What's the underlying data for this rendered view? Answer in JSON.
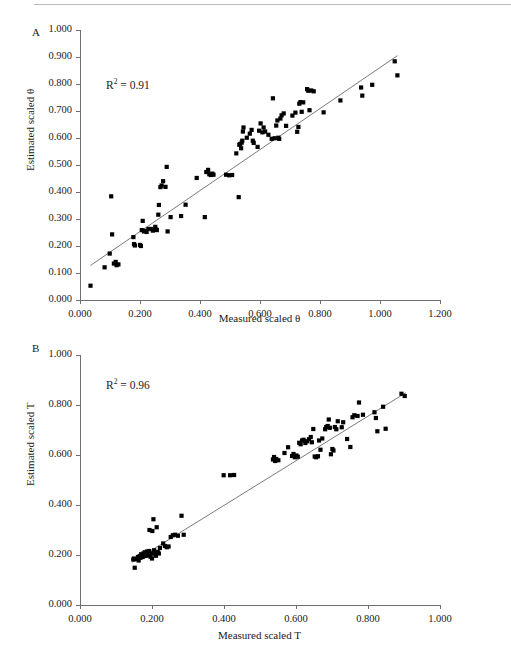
{
  "figure": {
    "background": "#ffffff",
    "point_color": "#000000",
    "line_color": "#7a7a7a",
    "axis_color": "#6f6f6f"
  },
  "panels": [
    {
      "letter": "A",
      "r2_prefix": "R",
      "r2_sup": "2",
      "r2_value": "= 0.91"
    },
    {
      "letter": "B",
      "r2_prefix": "R",
      "r2_sup": "2",
      "r2_value": "= 0.96"
    }
  ],
  "chart_data": [
    {
      "type": "scatter",
      "panel": "A",
      "title": "",
      "xlabel": "Measured scaled θ",
      "ylabel": "Estimated scaled θ",
      "annotation": "R² = 0.91",
      "r_squared": 0.91,
      "xlim": [
        0.0,
        1.2
      ],
      "ylim": [
        0.0,
        1.0
      ],
      "xticks": [
        "0.000",
        "0.200",
        "0.400",
        "0.600",
        "0.800",
        "1.000",
        "1.200"
      ],
      "xtick_values": [
        0.0,
        0.2,
        0.4,
        0.6,
        0.8,
        1.0,
        1.2
      ],
      "yticks": [
        "0.000",
        "0.100",
        "0.200",
        "0.300",
        "0.400",
        "0.500",
        "0.600",
        "0.700",
        "0.800",
        "0.900",
        "1.000"
      ],
      "ytick_values": [
        0.0,
        0.1,
        0.2,
        0.3,
        0.4,
        0.5,
        0.6,
        0.7,
        0.8,
        0.9,
        1.0
      ],
      "grid": false,
      "legend": false,
      "fit_line": {
        "x": [
          0.035,
          1.058
        ],
        "y": [
          0.128,
          0.905
        ]
      },
      "points": [
        [
          0.035,
          0.053
        ],
        [
          0.082,
          0.121
        ],
        [
          0.099,
          0.172
        ],
        [
          0.104,
          0.384
        ],
        [
          0.113,
          0.135
        ],
        [
          0.119,
          0.141
        ],
        [
          0.122,
          0.129
        ],
        [
          0.128,
          0.132
        ],
        [
          0.107,
          0.243
        ],
        [
          0.178,
          0.233
        ],
        [
          0.18,
          0.207
        ],
        [
          0.183,
          0.202
        ],
        [
          0.2,
          0.204
        ],
        [
          0.203,
          0.2
        ],
        [
          0.206,
          0.259
        ],
        [
          0.209,
          0.293
        ],
        [
          0.213,
          0.254
        ],
        [
          0.219,
          0.256
        ],
        [
          0.222,
          0.252
        ],
        [
          0.228,
          0.263
        ],
        [
          0.236,
          0.263
        ],
        [
          0.243,
          0.257
        ],
        [
          0.248,
          0.262
        ],
        [
          0.251,
          0.271
        ],
        [
          0.254,
          0.261
        ],
        [
          0.256,
          0.259
        ],
        [
          0.261,
          0.316
        ],
        [
          0.263,
          0.352
        ],
        [
          0.268,
          0.418
        ],
        [
          0.272,
          0.424
        ],
        [
          0.277,
          0.44
        ],
        [
          0.285,
          0.419
        ],
        [
          0.289,
          0.493
        ],
        [
          0.292,
          0.254
        ],
        [
          0.302,
          0.307
        ],
        [
          0.337,
          0.311
        ],
        [
          0.352,
          0.353
        ],
        [
          0.389,
          0.452
        ],
        [
          0.416,
          0.307
        ],
        [
          0.421,
          0.474
        ],
        [
          0.427,
          0.482
        ],
        [
          0.431,
          0.466
        ],
        [
          0.436,
          0.463
        ],
        [
          0.441,
          0.468
        ],
        [
          0.445,
          0.464
        ],
        [
          0.487,
          0.464
        ],
        [
          0.497,
          0.462
        ],
        [
          0.507,
          0.463
        ],
        [
          0.521,
          0.543
        ],
        [
          0.529,
          0.381
        ],
        [
          0.531,
          0.575
        ],
        [
          0.534,
          0.578
        ],
        [
          0.537,
          0.562
        ],
        [
          0.539,
          0.583
        ],
        [
          0.541,
          0.59
        ],
        [
          0.543,
          0.624
        ],
        [
          0.545,
          0.639
        ],
        [
          0.556,
          0.601
        ],
        [
          0.566,
          0.616
        ],
        [
          0.572,
          0.63
        ],
        [
          0.576,
          0.59
        ],
        [
          0.579,
          0.582
        ],
        [
          0.592,
          0.567
        ],
        [
          0.597,
          0.627
        ],
        [
          0.602,
          0.654
        ],
        [
          0.608,
          0.621
        ],
        [
          0.612,
          0.639
        ],
        [
          0.617,
          0.624
        ],
        [
          0.628,
          0.612
        ],
        [
          0.639,
          0.597
        ],
        [
          0.643,
          0.747
        ],
        [
          0.649,
          0.599
        ],
        [
          0.654,
          0.646
        ],
        [
          0.658,
          0.665
        ],
        [
          0.661,
          0.601
        ],
        [
          0.664,
          0.597
        ],
        [
          0.668,
          0.672
        ],
        [
          0.672,
          0.684
        ],
        [
          0.679,
          0.691
        ],
        [
          0.687,
          0.645
        ],
        [
          0.708,
          0.683
        ],
        [
          0.718,
          0.694
        ],
        [
          0.724,
          0.623
        ],
        [
          0.728,
          0.641
        ],
        [
          0.731,
          0.727
        ],
        [
          0.735,
          0.733
        ],
        [
          0.739,
          0.697
        ],
        [
          0.744,
          0.732
        ],
        [
          0.757,
          0.781
        ],
        [
          0.761,
          0.775
        ],
        [
          0.765,
          0.703
        ],
        [
          0.771,
          0.776
        ],
        [
          0.779,
          0.773
        ],
        [
          0.812,
          0.695
        ],
        [
          0.868,
          0.739
        ],
        [
          0.937,
          0.787
        ],
        [
          0.941,
          0.757
        ],
        [
          0.974,
          0.797
        ],
        [
          1.049,
          0.884
        ],
        [
          1.058,
          0.832
        ]
      ]
    },
    {
      "type": "scatter",
      "panel": "B",
      "title": "",
      "xlabel": "Measured scaled T",
      "ylabel": "Estimated scaled T",
      "annotation": "R² = 0.96",
      "r_squared": 0.96,
      "xlim": [
        0.0,
        1.0
      ],
      "ylim": [
        0.0,
        1.0
      ],
      "xticks": [
        "0.000",
        "0.200",
        "0.400",
        "0.600",
        "0.800",
        "1.000"
      ],
      "xtick_values": [
        0.0,
        0.2,
        0.4,
        0.6,
        0.8,
        1.0
      ],
      "yticks": [
        "0.000",
        "0.200",
        "0.400",
        "0.600",
        "0.800",
        "1.000"
      ],
      "ytick_values": [
        0.0,
        0.2,
        0.4,
        0.6,
        0.8,
        1.0
      ],
      "grid": false,
      "legend": false,
      "fit_line": {
        "x": [
          0.145,
          0.905
        ],
        "y": [
          0.171,
          0.849
        ]
      },
      "points": [
        [
          0.148,
          0.182
        ],
        [
          0.15,
          0.186
        ],
        [
          0.152,
          0.149
        ],
        [
          0.158,
          0.183
        ],
        [
          0.161,
          0.192
        ],
        [
          0.163,
          0.178
        ],
        [
          0.166,
          0.196
        ],
        [
          0.168,
          0.189
        ],
        [
          0.17,
          0.203
        ],
        [
          0.172,
          0.198
        ],
        [
          0.174,
          0.192
        ],
        [
          0.176,
          0.206
        ],
        [
          0.178,
          0.2
        ],
        [
          0.18,
          0.211
        ],
        [
          0.182,
          0.196
        ],
        [
          0.184,
          0.204
        ],
        [
          0.186,
          0.214
        ],
        [
          0.188,
          0.198
        ],
        [
          0.19,
          0.208
        ],
        [
          0.192,
          0.216
        ],
        [
          0.194,
          0.201
        ],
        [
          0.196,
          0.193
        ],
        [
          0.198,
          0.207
        ],
        [
          0.2,
          0.186
        ],
        [
          0.193,
          0.3
        ],
        [
          0.201,
          0.296
        ],
        [
          0.204,
          0.343
        ],
        [
          0.206,
          0.219
        ],
        [
          0.209,
          0.204
        ],
        [
          0.211,
          0.197
        ],
        [
          0.213,
          0.311
        ],
        [
          0.216,
          0.212
        ],
        [
          0.219,
          0.206
        ],
        [
          0.222,
          0.228
        ],
        [
          0.231,
          0.246
        ],
        [
          0.236,
          0.236
        ],
        [
          0.241,
          0.231
        ],
        [
          0.246,
          0.234
        ],
        [
          0.252,
          0.272
        ],
        [
          0.258,
          0.279
        ],
        [
          0.264,
          0.281
        ],
        [
          0.272,
          0.277
        ],
        [
          0.282,
          0.357
        ],
        [
          0.288,
          0.281
        ],
        [
          0.399,
          0.519
        ],
        [
          0.417,
          0.519
        ],
        [
          0.428,
          0.52
        ],
        [
          0.536,
          0.582
        ],
        [
          0.539,
          0.592
        ],
        [
          0.542,
          0.576
        ],
        [
          0.545,
          0.584
        ],
        [
          0.551,
          0.579
        ],
        [
          0.568,
          0.608
        ],
        [
          0.578,
          0.631
        ],
        [
          0.589,
          0.596
        ],
        [
          0.593,
          0.604
        ],
        [
          0.597,
          0.591
        ],
        [
          0.601,
          0.598
        ],
        [
          0.605,
          0.593
        ],
        [
          0.609,
          0.649
        ],
        [
          0.613,
          0.643
        ],
        [
          0.617,
          0.658
        ],
        [
          0.621,
          0.661
        ],
        [
          0.626,
          0.648
        ],
        [
          0.631,
          0.655
        ],
        [
          0.636,
          0.663
        ],
        [
          0.641,
          0.672
        ],
        [
          0.644,
          0.651
        ],
        [
          0.648,
          0.704
        ],
        [
          0.652,
          0.594
        ],
        [
          0.656,
          0.591
        ],
        [
          0.661,
          0.595
        ],
        [
          0.664,
          0.658
        ],
        [
          0.668,
          0.621
        ],
        [
          0.673,
          0.666
        ],
        [
          0.681,
          0.703
        ],
        [
          0.684,
          0.712
        ],
        [
          0.688,
          0.716
        ],
        [
          0.691,
          0.742
        ],
        [
          0.694,
          0.709
        ],
        [
          0.697,
          0.603
        ],
        [
          0.701,
          0.624
        ],
        [
          0.704,
          0.618
        ],
        [
          0.708,
          0.712
        ],
        [
          0.712,
          0.703
        ],
        [
          0.716,
          0.735
        ],
        [
          0.727,
          0.711
        ],
        [
          0.731,
          0.731
        ],
        [
          0.742,
          0.664
        ],
        [
          0.751,
          0.632
        ],
        [
          0.757,
          0.751
        ],
        [
          0.762,
          0.759
        ],
        [
          0.771,
          0.756
        ],
        [
          0.775,
          0.81
        ],
        [
          0.786,
          0.761
        ],
        [
          0.818,
          0.771
        ],
        [
          0.822,
          0.748
        ],
        [
          0.826,
          0.695
        ],
        [
          0.842,
          0.793
        ],
        [
          0.849,
          0.705
        ],
        [
          0.893,
          0.845
        ],
        [
          0.902,
          0.836
        ]
      ]
    }
  ]
}
